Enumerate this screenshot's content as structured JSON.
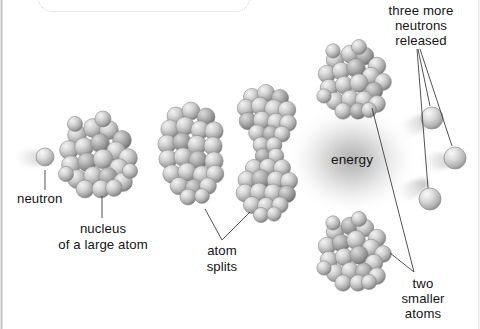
{
  "diagram": {
    "background_color": "#ffffff",
    "sphere_color": "#b9b9b9",
    "line_color": "#5a5a5a",
    "text_color": "#141414",
    "energy_glow_color": "#9a9a9a"
  },
  "labels": {
    "neutron": "neutron",
    "nucleus_line1": "nucleus",
    "nucleus_line2": "of a large atom",
    "atom_splits_line1": "atom",
    "atom_splits_line2": "splits",
    "energy": "energy",
    "released_line1": "three more",
    "released_line2": "neutrons",
    "released_line3": "released",
    "two_smaller_line1": "two",
    "two_smaller_line2": "smaller",
    "two_smaller_line3": "atoms"
  },
  "stages": [
    {
      "name": "incoming-neutron",
      "kind": "neutron",
      "cx": 45,
      "cy": 158,
      "r": 9
    },
    {
      "name": "target-nucleus",
      "kind": "cluster-round",
      "cx": 99,
      "cy": 155,
      "rx": 34,
      "ry": 37
    },
    {
      "name": "deformed-nucleus",
      "kind": "cluster-oval",
      "cx": 194,
      "cy": 152,
      "rx": 30,
      "ry": 45
    },
    {
      "name": "necking-nucleus",
      "kind": "cluster-dumbbell",
      "cx": 268,
      "cy": 153,
      "rx": 30,
      "ry": 62
    },
    {
      "name": "fragment-atom-upper",
      "kind": "cluster-round",
      "cx": 355,
      "cy": 80,
      "rx": 33,
      "ry": 35
    },
    {
      "name": "fragment-atom-lower",
      "kind": "cluster-round",
      "cx": 355,
      "cy": 252,
      "rx": 33,
      "ry": 34
    },
    {
      "name": "released-neutron-1",
      "kind": "neutron",
      "cx": 432,
      "cy": 118,
      "r": 11
    },
    {
      "name": "released-neutron-2",
      "kind": "neutron",
      "cx": 455,
      "cy": 158,
      "r": 11
    },
    {
      "name": "released-neutron-3",
      "kind": "neutron",
      "cx": 430,
      "cy": 199,
      "r": 11
    }
  ],
  "energy_glow": {
    "cx": 352,
    "cy": 160,
    "rx": 62,
    "ry": 52
  }
}
